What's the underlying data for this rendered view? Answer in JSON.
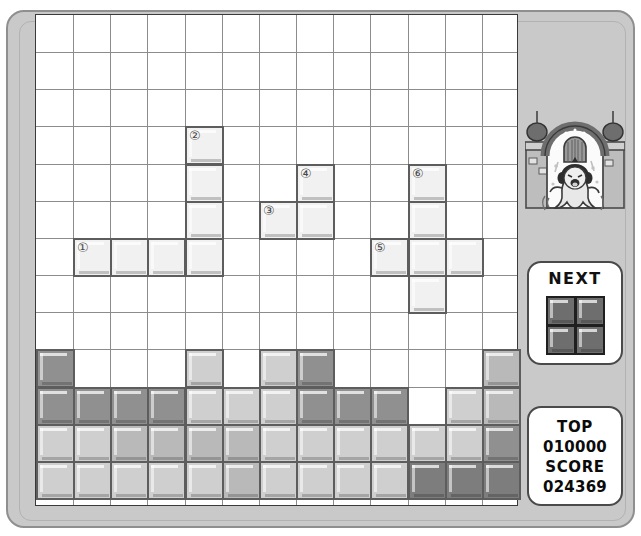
{
  "game": {
    "title": "Block Puzzle Console",
    "grid": {
      "cols": 13,
      "rows": 13,
      "cell": 37.15
    },
    "colors": {
      "shell": "#c9c9c9",
      "shell_border": "#8f8f8f",
      "grid_line": "#8c8c8c",
      "block_border": "#5d5d5d",
      "block_light": "#f1f1f1",
      "block_mid": "#cfcfcf",
      "block_gray": "#b9b9b9",
      "block_dark": "#909090",
      "block_darker": "#7d7d7d",
      "next_piece": "#6e6e6e",
      "text": "#0b0b0b"
    }
  },
  "next": {
    "label": "NEXT",
    "piece_name": "O-piece",
    "cells": [
      [
        0,
        0
      ],
      [
        1,
        0
      ],
      [
        0,
        1
      ],
      [
        1,
        1
      ]
    ]
  },
  "score": {
    "top_label": "TOP",
    "top_value": "010000",
    "score_label": "SCORE",
    "score_value": "024369"
  },
  "character": {
    "name": "ghost-in-castle-window",
    "description": "Cartoon ghost with dark hair floating in a castle archway window"
  },
  "falling_pieces": [
    {
      "number": "①",
      "name": "piece-1-j-block",
      "shade": "block_light",
      "cells": [
        [
          1,
          6
        ],
        [
          2,
          6
        ],
        [
          3,
          6
        ],
        [
          4,
          6
        ]
      ],
      "label_cell": [
        1,
        6
      ]
    },
    {
      "number": "②",
      "name": "piece-2-j-block",
      "shade": "block_light",
      "cells": [
        [
          4,
          3
        ],
        [
          4,
          4
        ],
        [
          4,
          5
        ]
      ],
      "label_cell": [
        4,
        3
      ]
    },
    {
      "number": "③",
      "name": "piece-3-s-block",
      "shade": "block_light",
      "cells": [
        [
          6,
          5
        ],
        [
          7,
          5
        ]
      ],
      "label_cell": [
        6,
        5
      ]
    },
    {
      "number": "④",
      "name": "piece-4-s-block",
      "shade": "block_light",
      "cells": [
        [
          7,
          4
        ]
      ],
      "label_cell": [
        7,
        4
      ]
    },
    {
      "number": "⑤",
      "name": "piece-5-plus-block",
      "shade": "block_light",
      "cells": [
        [
          9,
          6
        ]
      ],
      "label_cell": [
        9,
        6
      ]
    },
    {
      "number": "⑥",
      "name": "piece-6-plus-block",
      "shade": "block_light",
      "cells": [
        [
          10,
          4
        ],
        [
          10,
          5
        ],
        [
          10,
          6
        ],
        [
          11,
          6
        ],
        [
          10,
          7
        ]
      ],
      "label_cell": [
        10,
        4
      ]
    }
  ],
  "stack": {
    "rows": [
      {
        "y": 9,
        "cells": [
          {
            "x": 0,
            "shade": "block_dark"
          },
          {
            "x": 4,
            "shade": "block_mid"
          },
          {
            "x": 6,
            "shade": "block_mid"
          },
          {
            "x": 7,
            "shade": "block_dark"
          },
          {
            "x": 12,
            "shade": "block_gray"
          }
        ]
      },
      {
        "y": 10,
        "cells": [
          {
            "x": 0,
            "shade": "block_dark"
          },
          {
            "x": 1,
            "shade": "block_dark"
          },
          {
            "x": 2,
            "shade": "block_dark"
          },
          {
            "x": 3,
            "shade": "block_dark"
          },
          {
            "x": 4,
            "shade": "block_mid"
          },
          {
            "x": 5,
            "shade": "block_mid"
          },
          {
            "x": 6,
            "shade": "block_mid"
          },
          {
            "x": 7,
            "shade": "block_dark"
          },
          {
            "x": 8,
            "shade": "block_dark"
          },
          {
            "x": 9,
            "shade": "block_dark"
          },
          {
            "x": 11,
            "shade": "block_mid"
          },
          {
            "x": 12,
            "shade": "block_gray"
          }
        ]
      },
      {
        "y": 11,
        "cells": [
          {
            "x": 0,
            "shade": "block_mid"
          },
          {
            "x": 1,
            "shade": "block_mid"
          },
          {
            "x": 2,
            "shade": "block_gray"
          },
          {
            "x": 3,
            "shade": "block_gray"
          },
          {
            "x": 4,
            "shade": "block_gray"
          },
          {
            "x": 5,
            "shade": "block_gray"
          },
          {
            "x": 6,
            "shade": "block_mid"
          },
          {
            "x": 7,
            "shade": "block_mid"
          },
          {
            "x": 8,
            "shade": "block_mid"
          },
          {
            "x": 9,
            "shade": "block_mid"
          },
          {
            "x": 10,
            "shade": "block_mid"
          },
          {
            "x": 11,
            "shade": "block_mid"
          },
          {
            "x": 12,
            "shade": "block_dark"
          }
        ]
      },
      {
        "y": 12,
        "cells": [
          {
            "x": 0,
            "shade": "block_mid"
          },
          {
            "x": 1,
            "shade": "block_mid"
          },
          {
            "x": 2,
            "shade": "block_mid"
          },
          {
            "x": 3,
            "shade": "block_mid"
          },
          {
            "x": 4,
            "shade": "block_mid"
          },
          {
            "x": 5,
            "shade": "block_gray"
          },
          {
            "x": 6,
            "shade": "block_mid"
          },
          {
            "x": 7,
            "shade": "block_mid"
          },
          {
            "x": 8,
            "shade": "block_mid"
          },
          {
            "x": 9,
            "shade": "block_mid"
          },
          {
            "x": 10,
            "shade": "block_darker"
          },
          {
            "x": 11,
            "shade": "block_darker"
          },
          {
            "x": 12,
            "shade": "block_darker"
          }
        ]
      }
    ]
  }
}
